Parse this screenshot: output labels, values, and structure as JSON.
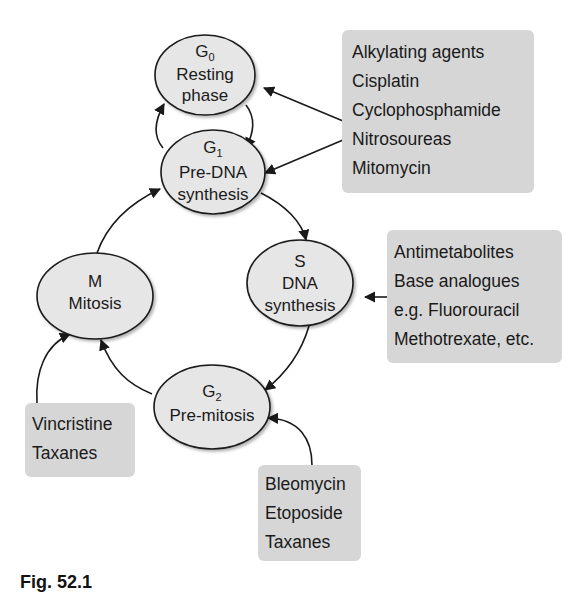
{
  "phases": {
    "g0": {
      "symbol": "G",
      "subscript": "0",
      "line1": "Resting",
      "line2": "phase"
    },
    "g1": {
      "symbol": "G",
      "subscript": "1",
      "line1": "Pre-DNA",
      "line2": "synthesis"
    },
    "s": {
      "symbol": "S",
      "line1": "DNA",
      "line2": "synthesis"
    },
    "m": {
      "symbol": "M",
      "line1": "Mitosis"
    },
    "g2": {
      "symbol": "G",
      "subscript": "2",
      "line1": "Pre-mitosis"
    }
  },
  "drug_boxes": {
    "alkylating": {
      "items": [
        "Alkylating agents",
        "Cisplatin",
        "Cyclophosphamide",
        "Nitrosoureas",
        "Mitomycin"
      ],
      "targets": [
        "G0",
        "G1"
      ]
    },
    "antimetabolites": {
      "items": [
        "Antimetabolites",
        "Base analogues",
        "e.g. Fluorouracil",
        "Methotrexate, etc."
      ],
      "targets": [
        "S"
      ]
    },
    "mitotic": {
      "items": [
        "Vincristine",
        "Taxanes"
      ],
      "targets": [
        "M"
      ]
    },
    "g2_agents": {
      "items": [
        "Bleomycin",
        "Etoposide",
        "Taxanes"
      ],
      "targets": [
        "G2"
      ]
    }
  },
  "caption": "Fig. 52.1",
  "colors": {
    "ellipse_fill": "#e6e6e6",
    "box_fill": "#d6d6d6",
    "stroke": "#1a1a1a"
  }
}
